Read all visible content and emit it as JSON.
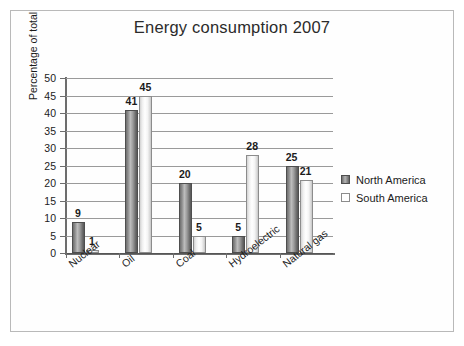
{
  "chart_data": {
    "type": "bar",
    "title": "Energy consumption 2007",
    "xlabel": "",
    "ylabel": "Percentage of total",
    "ylim": [
      0,
      50
    ],
    "ytick_step": 5,
    "yticks": [
      "50",
      "45",
      "40",
      "35",
      "30",
      "25",
      "20",
      "15",
      "10",
      "5",
      "0"
    ],
    "grid": "horizontal",
    "legend_position": "right",
    "categories": [
      "Nuclear",
      "Oil",
      "Coal",
      "Hydroelectric",
      "Natural gas"
    ],
    "series": [
      {
        "name": "North America",
        "color": "#8d8d8d",
        "values": [
          9,
          41,
          20,
          5,
          25
        ]
      },
      {
        "name": "South America",
        "color": "#ffffff",
        "values": [
          1,
          45,
          5,
          28,
          21
        ]
      }
    ]
  },
  "legend": {
    "items": [
      {
        "label": "North America",
        "swatch": "north"
      },
      {
        "label": "South America",
        "swatch": "south"
      }
    ]
  }
}
